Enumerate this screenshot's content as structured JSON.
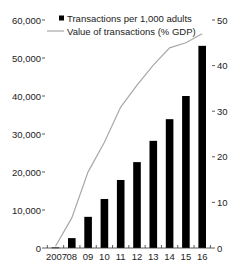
{
  "chart_data": {
    "type": "bar+line",
    "title": "",
    "categories": [
      "2007",
      "08",
      "09",
      "10",
      "11",
      "12",
      "13",
      "14",
      "15",
      "16"
    ],
    "series": [
      {
        "name": "Transactions per 1,000 adults",
        "type": "bar",
        "axis": "left",
        "color": "#000000",
        "values": [
          150,
          2600,
          8200,
          12900,
          17900,
          22600,
          28200,
          33900,
          40000,
          53200
        ]
      },
      {
        "name": "Value of transactions (% GDP)",
        "type": "line",
        "axis": "right",
        "color": "#a8a8a8",
        "values": [
          0.4,
          6.6,
          16.7,
          23.2,
          30.9,
          35.7,
          40.1,
          43.9,
          45.0,
          47.0
        ]
      }
    ],
    "left_axis": {
      "ylim": [
        0,
        60000
      ],
      "ticks": [
        0,
        10000,
        20000,
        30000,
        40000,
        50000,
        60000
      ],
      "tick_labels": [
        "0",
        "10,000",
        "20,000",
        "30,000",
        "40,000",
        "50,000",
        "60,000"
      ]
    },
    "right_axis": {
      "ylim": [
        0,
        50
      ],
      "ticks": [
        0,
        10,
        20,
        30,
        40,
        50
      ],
      "tick_labels": [
        "0",
        "10",
        "20",
        "30",
        "40",
        "50"
      ]
    },
    "xlabel": "",
    "ylabel_left": "",
    "ylabel_right": "",
    "grid": false,
    "legend_position": "top-left-inside"
  },
  "legend": {
    "bar_label": "Transactions per 1,000 adults",
    "line_label": "Value of transactions (% GDP)"
  }
}
